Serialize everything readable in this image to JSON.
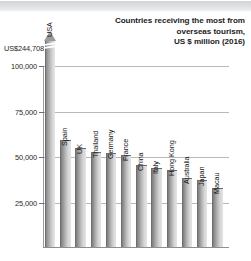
{
  "chart_data": {
    "type": "bar",
    "title": "Countries receiving the most from overseas tourism, US $ million (2016)",
    "title_lines": [
      "Countries receiving the most from",
      "overseas tourism,",
      "US $ million (2016)"
    ],
    "xlabel": "",
    "ylabel": "",
    "ylim": [
      0,
      100000
    ],
    "grid": true,
    "legend": "none",
    "yticks": [
      25000,
      50000,
      75000,
      100000
    ],
    "ytick_labels": [
      "25,000",
      "50,000",
      "75,000",
      "100,000"
    ],
    "top_annotation": "US$244,708",
    "axis_broken": true,
    "categories": [
      "USA",
      "Spain",
      "UK",
      "Thailand",
      "Germany",
      "France",
      "China",
      "Italy",
      "Hong Kong",
      "Australia",
      "Japan",
      "Macau"
    ],
    "values": [
      244708,
      60346,
      51204,
      49871,
      48185,
      47345,
      44432,
      40246,
      38877,
      34206,
      33031,
      29200
    ],
    "bars": [
      {
        "label": "USA",
        "value": 244708,
        "truncated": true,
        "top_px": 40
      },
      {
        "label": "Spain",
        "value": 60346,
        "truncated": false,
        "top_px": 140
      },
      {
        "label": "UK",
        "value": 51204,
        "truncated": false,
        "top_px": 148
      },
      {
        "label": "Thailand",
        "value": 49871,
        "truncated": false,
        "top_px": 152
      },
      {
        "label": "Germany",
        "value": 48185,
        "truncated": false,
        "top_px": 153
      },
      {
        "label": "France",
        "value": 47345,
        "truncated": false,
        "top_px": 155
      },
      {
        "label": "China",
        "value": 44432,
        "truncated": false,
        "top_px": 165
      },
      {
        "label": "Italy",
        "value": 40246,
        "truncated": false,
        "top_px": 168
      },
      {
        "label": "Hong Kong",
        "value": 38877,
        "truncated": false,
        "top_px": 170
      },
      {
        "label": "Australia",
        "value": 34206,
        "truncated": false,
        "top_px": 178
      },
      {
        "label": "Japan",
        "value": 33031,
        "truncated": false,
        "top_px": 180
      },
      {
        "label": "Macau",
        "value": 29200,
        "truncated": false,
        "top_px": 188
      }
    ],
    "colors": {
      "bar_dark": "#7c7c7c",
      "bar_light": "#e4e4e4",
      "axis": "#8e8e8e",
      "grid": "#b9b9b9",
      "text": "#1c1c1c",
      "banner": "#dcdee0"
    }
  }
}
